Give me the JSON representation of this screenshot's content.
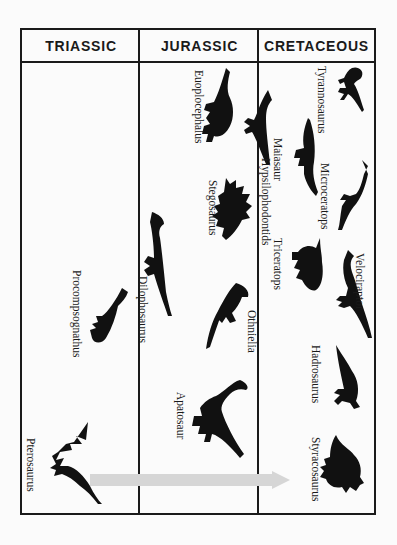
{
  "periods": [
    {
      "label": "TRIASSIC"
    },
    {
      "label": "JURASSIC"
    },
    {
      "label": "CRETACEOUS"
    }
  ],
  "arrow": {
    "color": "#d6d6d6",
    "direction": "right"
  },
  "dinosaurs": [
    {
      "name": "Tyrannosaurus",
      "period": "CRETACEOUS"
    },
    {
      "name": "Maiasaur",
      "period": "CRETACEOUS"
    },
    {
      "name": "Microceratops",
      "period": "CRETACEOUS"
    },
    {
      "name": "Triceratops",
      "period": "CRETACEOUS"
    },
    {
      "name": "Velociraptor",
      "period": "CRETACEOUS"
    },
    {
      "name": "Hadrosaurus",
      "period": "CRETACEOUS"
    },
    {
      "name": "Styracosaurus",
      "period": "CRETACEOUS"
    },
    {
      "name": "Euoplocephalus",
      "period": "JURASSIC"
    },
    {
      "name": "Hypsilophodontids",
      "period": "JURASSIC"
    },
    {
      "name": "Stegosaurus",
      "period": "JURASSIC"
    },
    {
      "name": "Dilophosaurus",
      "period": "JURASSIC"
    },
    {
      "name": "Othnielia",
      "period": "JURASSIC"
    },
    {
      "name": "Apatosaur",
      "period": "JURASSIC"
    },
    {
      "name": "Procompsognathus",
      "period": "TRIASSIC"
    },
    {
      "name": "Pterosaurus",
      "period": "TRIASSIC"
    }
  ]
}
